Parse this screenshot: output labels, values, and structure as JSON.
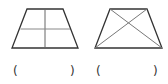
{
  "figures": [
    {
      "id": "trapezoid-divided-grid",
      "description": "trapezoid divided by one vertical and one horizontal line into four parts",
      "answer_blank": {
        "open": "(",
        "close": ")",
        "value": ""
      }
    },
    {
      "id": "trapezoid-with-diagonals",
      "description": "trapezoid with both diagonals drawn",
      "answer_blank": {
        "open": "(",
        "close": ")",
        "value": ""
      }
    }
  ],
  "colors": {
    "outline": "#333333",
    "inner_lines": "#777777"
  }
}
